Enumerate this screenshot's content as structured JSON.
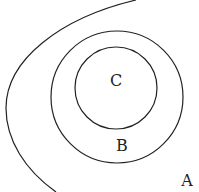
{
  "diagram": {
    "type": "nested-sets",
    "sets": [
      {
        "id": "A",
        "label": "A",
        "shape": "open-curve"
      },
      {
        "id": "B",
        "label": "B",
        "shape": "circle"
      },
      {
        "id": "C",
        "label": "C",
        "shape": "circle"
      }
    ],
    "relation": "C ⊂ B ⊂ A",
    "stroke_color": "#222222"
  }
}
